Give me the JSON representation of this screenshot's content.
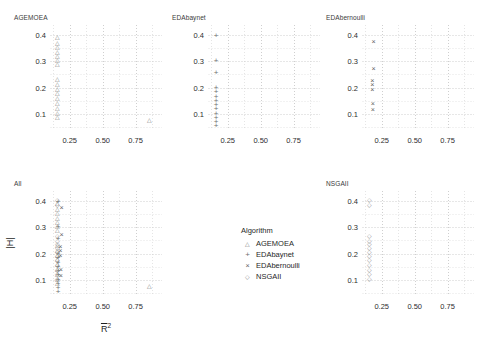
{
  "chart_data": {
    "type": "scatter",
    "title": "",
    "xlabel": "R̄²",
    "ylabel": "|H|",
    "xlim": [
      0.1,
      0.95
    ],
    "ylim": [
      0.04,
      0.44
    ],
    "xticks": [
      "0.25",
      "0.50",
      "0.75"
    ],
    "xtick_values": [
      0.25,
      0.5,
      0.75
    ],
    "yticks": [
      "0.1",
      "0.2",
      "0.3",
      "0.4"
    ],
    "ytick_values": [
      0.1,
      0.2,
      0.3,
      0.4
    ],
    "grid": true,
    "legend": {
      "title": "Algorithm",
      "position": "bottom-center-facet",
      "entries": [
        {
          "name": "AGEMOEA",
          "marker": "triangle",
          "glyph": "△"
        },
        {
          "name": "EDAbaynet",
          "marker": "plus",
          "glyph": "+"
        },
        {
          "name": "EDAbernoulli",
          "marker": "cross",
          "glyph": "×"
        },
        {
          "name": "NSGAII",
          "marker": "diamond",
          "glyph": "◇"
        }
      ]
    },
    "facets": [
      {
        "name": "AGEMOEA",
        "marker": "triangle",
        "glyph": "△",
        "points": [
          {
            "x": 0.158,
            "y": 0.392
          },
          {
            "x": 0.158,
            "y": 0.368
          },
          {
            "x": 0.158,
            "y": 0.352
          },
          {
            "x": 0.158,
            "y": 0.336
          },
          {
            "x": 0.158,
            "y": 0.32
          },
          {
            "x": 0.158,
            "y": 0.304
          },
          {
            "x": 0.158,
            "y": 0.288
          },
          {
            "x": 0.158,
            "y": 0.232
          },
          {
            "x": 0.158,
            "y": 0.214
          },
          {
            "x": 0.158,
            "y": 0.196
          },
          {
            "x": 0.158,
            "y": 0.178
          },
          {
            "x": 0.158,
            "y": 0.16
          },
          {
            "x": 0.158,
            "y": 0.142
          },
          {
            "x": 0.158,
            "y": 0.124
          },
          {
            "x": 0.158,
            "y": 0.106
          },
          {
            "x": 0.158,
            "y": 0.09
          },
          {
            "x": 0.852,
            "y": 0.078
          }
        ]
      },
      {
        "name": "EDAbaynet",
        "marker": "plus",
        "glyph": "+",
        "points": [
          {
            "x": 0.162,
            "y": 0.394
          },
          {
            "x": 0.162,
            "y": 0.3
          },
          {
            "x": 0.162,
            "y": 0.256
          },
          {
            "x": 0.162,
            "y": 0.2
          },
          {
            "x": 0.162,
            "y": 0.182
          },
          {
            "x": 0.162,
            "y": 0.166
          },
          {
            "x": 0.162,
            "y": 0.15
          },
          {
            "x": 0.162,
            "y": 0.134
          },
          {
            "x": 0.162,
            "y": 0.118
          },
          {
            "x": 0.162,
            "y": 0.102
          },
          {
            "x": 0.162,
            "y": 0.086
          },
          {
            "x": 0.162,
            "y": 0.07
          },
          {
            "x": 0.162,
            "y": 0.054
          }
        ]
      },
      {
        "name": "EDAbernoulli",
        "marker": "cross",
        "glyph": "×",
        "points": [
          {
            "x": 0.188,
            "y": 0.372
          },
          {
            "x": 0.188,
            "y": 0.272
          },
          {
            "x": 0.178,
            "y": 0.224
          },
          {
            "x": 0.178,
            "y": 0.208
          },
          {
            "x": 0.178,
            "y": 0.192
          },
          {
            "x": 0.182,
            "y": 0.138
          },
          {
            "x": 0.182,
            "y": 0.116
          }
        ]
      },
      {
        "name": "All",
        "marker": "mixed",
        "glyph": "",
        "points": [
          {
            "x": 0.158,
            "y": 0.404,
            "marker": "diamond"
          },
          {
            "x": 0.158,
            "y": 0.392,
            "marker": "triangle"
          },
          {
            "x": 0.162,
            "y": 0.394,
            "marker": "plus"
          },
          {
            "x": 0.158,
            "y": 0.384,
            "marker": "diamond"
          },
          {
            "x": 0.158,
            "y": 0.368,
            "marker": "triangle"
          },
          {
            "x": 0.158,
            "y": 0.352,
            "marker": "triangle"
          },
          {
            "x": 0.188,
            "y": 0.372,
            "marker": "cross"
          },
          {
            "x": 0.158,
            "y": 0.336,
            "marker": "triangle"
          },
          {
            "x": 0.158,
            "y": 0.32,
            "marker": "triangle"
          },
          {
            "x": 0.158,
            "y": 0.304,
            "marker": "triangle"
          },
          {
            "x": 0.162,
            "y": 0.3,
            "marker": "plus"
          },
          {
            "x": 0.158,
            "y": 0.288,
            "marker": "triangle"
          },
          {
            "x": 0.188,
            "y": 0.272,
            "marker": "cross"
          },
          {
            "x": 0.158,
            "y": 0.268,
            "marker": "diamond"
          },
          {
            "x": 0.162,
            "y": 0.256,
            "marker": "plus"
          },
          {
            "x": 0.158,
            "y": 0.248,
            "marker": "diamond"
          },
          {
            "x": 0.158,
            "y": 0.236,
            "marker": "diamond"
          },
          {
            "x": 0.158,
            "y": 0.232,
            "marker": "triangle"
          },
          {
            "x": 0.178,
            "y": 0.224,
            "marker": "cross"
          },
          {
            "x": 0.158,
            "y": 0.222,
            "marker": "diamond"
          },
          {
            "x": 0.158,
            "y": 0.214,
            "marker": "triangle"
          },
          {
            "x": 0.178,
            "y": 0.208,
            "marker": "cross"
          },
          {
            "x": 0.158,
            "y": 0.206,
            "marker": "diamond"
          },
          {
            "x": 0.162,
            "y": 0.2,
            "marker": "plus"
          },
          {
            "x": 0.158,
            "y": 0.196,
            "marker": "triangle"
          },
          {
            "x": 0.178,
            "y": 0.192,
            "marker": "cross"
          },
          {
            "x": 0.158,
            "y": 0.19,
            "marker": "diamond"
          },
          {
            "x": 0.162,
            "y": 0.182,
            "marker": "plus"
          },
          {
            "x": 0.158,
            "y": 0.178,
            "marker": "triangle"
          },
          {
            "x": 0.158,
            "y": 0.174,
            "marker": "diamond"
          },
          {
            "x": 0.162,
            "y": 0.166,
            "marker": "plus"
          },
          {
            "x": 0.158,
            "y": 0.16,
            "marker": "triangle"
          },
          {
            "x": 0.158,
            "y": 0.158,
            "marker": "diamond"
          },
          {
            "x": 0.162,
            "y": 0.15,
            "marker": "plus"
          },
          {
            "x": 0.158,
            "y": 0.142,
            "marker": "triangle"
          },
          {
            "x": 0.158,
            "y": 0.14,
            "marker": "diamond"
          },
          {
            "x": 0.182,
            "y": 0.138,
            "marker": "cross"
          },
          {
            "x": 0.162,
            "y": 0.134,
            "marker": "plus"
          },
          {
            "x": 0.158,
            "y": 0.124,
            "marker": "triangle"
          },
          {
            "x": 0.158,
            "y": 0.122,
            "marker": "diamond"
          },
          {
            "x": 0.162,
            "y": 0.118,
            "marker": "plus"
          },
          {
            "x": 0.182,
            "y": 0.116,
            "marker": "cross"
          },
          {
            "x": 0.158,
            "y": 0.106,
            "marker": "triangle"
          },
          {
            "x": 0.158,
            "y": 0.104,
            "marker": "diamond"
          },
          {
            "x": 0.162,
            "y": 0.102,
            "marker": "plus"
          },
          {
            "x": 0.158,
            "y": 0.09,
            "marker": "triangle"
          },
          {
            "x": 0.162,
            "y": 0.086,
            "marker": "plus"
          },
          {
            "x": 0.162,
            "y": 0.07,
            "marker": "plus"
          },
          {
            "x": 0.162,
            "y": 0.054,
            "marker": "plus"
          },
          {
            "x": 0.852,
            "y": 0.078,
            "marker": "triangle"
          }
        ]
      },
      {
        "name": "NSGAII",
        "marker": "diamond",
        "glyph": "◇",
        "points": [
          {
            "x": 0.158,
            "y": 0.404
          },
          {
            "x": 0.158,
            "y": 0.384
          },
          {
            "x": 0.158,
            "y": 0.268
          },
          {
            "x": 0.158,
            "y": 0.248
          },
          {
            "x": 0.158,
            "y": 0.236
          },
          {
            "x": 0.158,
            "y": 0.222
          },
          {
            "x": 0.158,
            "y": 0.206
          },
          {
            "x": 0.158,
            "y": 0.19
          },
          {
            "x": 0.158,
            "y": 0.174
          },
          {
            "x": 0.158,
            "y": 0.158
          },
          {
            "x": 0.158,
            "y": 0.14
          },
          {
            "x": 0.158,
            "y": 0.122
          },
          {
            "x": 0.158,
            "y": 0.104
          }
        ]
      }
    ]
  },
  "panels": {
    "agemoea": {
      "title": "AGEMOEA"
    },
    "edabaynet": {
      "title": "EDAbaynet"
    },
    "edabernoulli": {
      "title": "EDAbernoulli"
    },
    "all": {
      "title": "All"
    },
    "nsgaii": {
      "title": "NSGAII"
    }
  },
  "axes": {
    "xlabel_base": "R",
    "xlabel_sup": "2",
    "ylabel": "|H|"
  },
  "legend": {
    "title": "Algorithm",
    "items": [
      {
        "label": "AGEMOEA",
        "glyph": "△"
      },
      {
        "label": "EDAbaynet",
        "glyph": "+"
      },
      {
        "label": "EDAbernoulli",
        "glyph": "×"
      },
      {
        "label": "NSGAII",
        "glyph": "◇"
      }
    ]
  },
  "ticks": {
    "x": [
      "0.25",
      "0.50",
      "0.75"
    ],
    "y": [
      "0.4",
      "0.3",
      "0.2",
      "0.1"
    ]
  }
}
